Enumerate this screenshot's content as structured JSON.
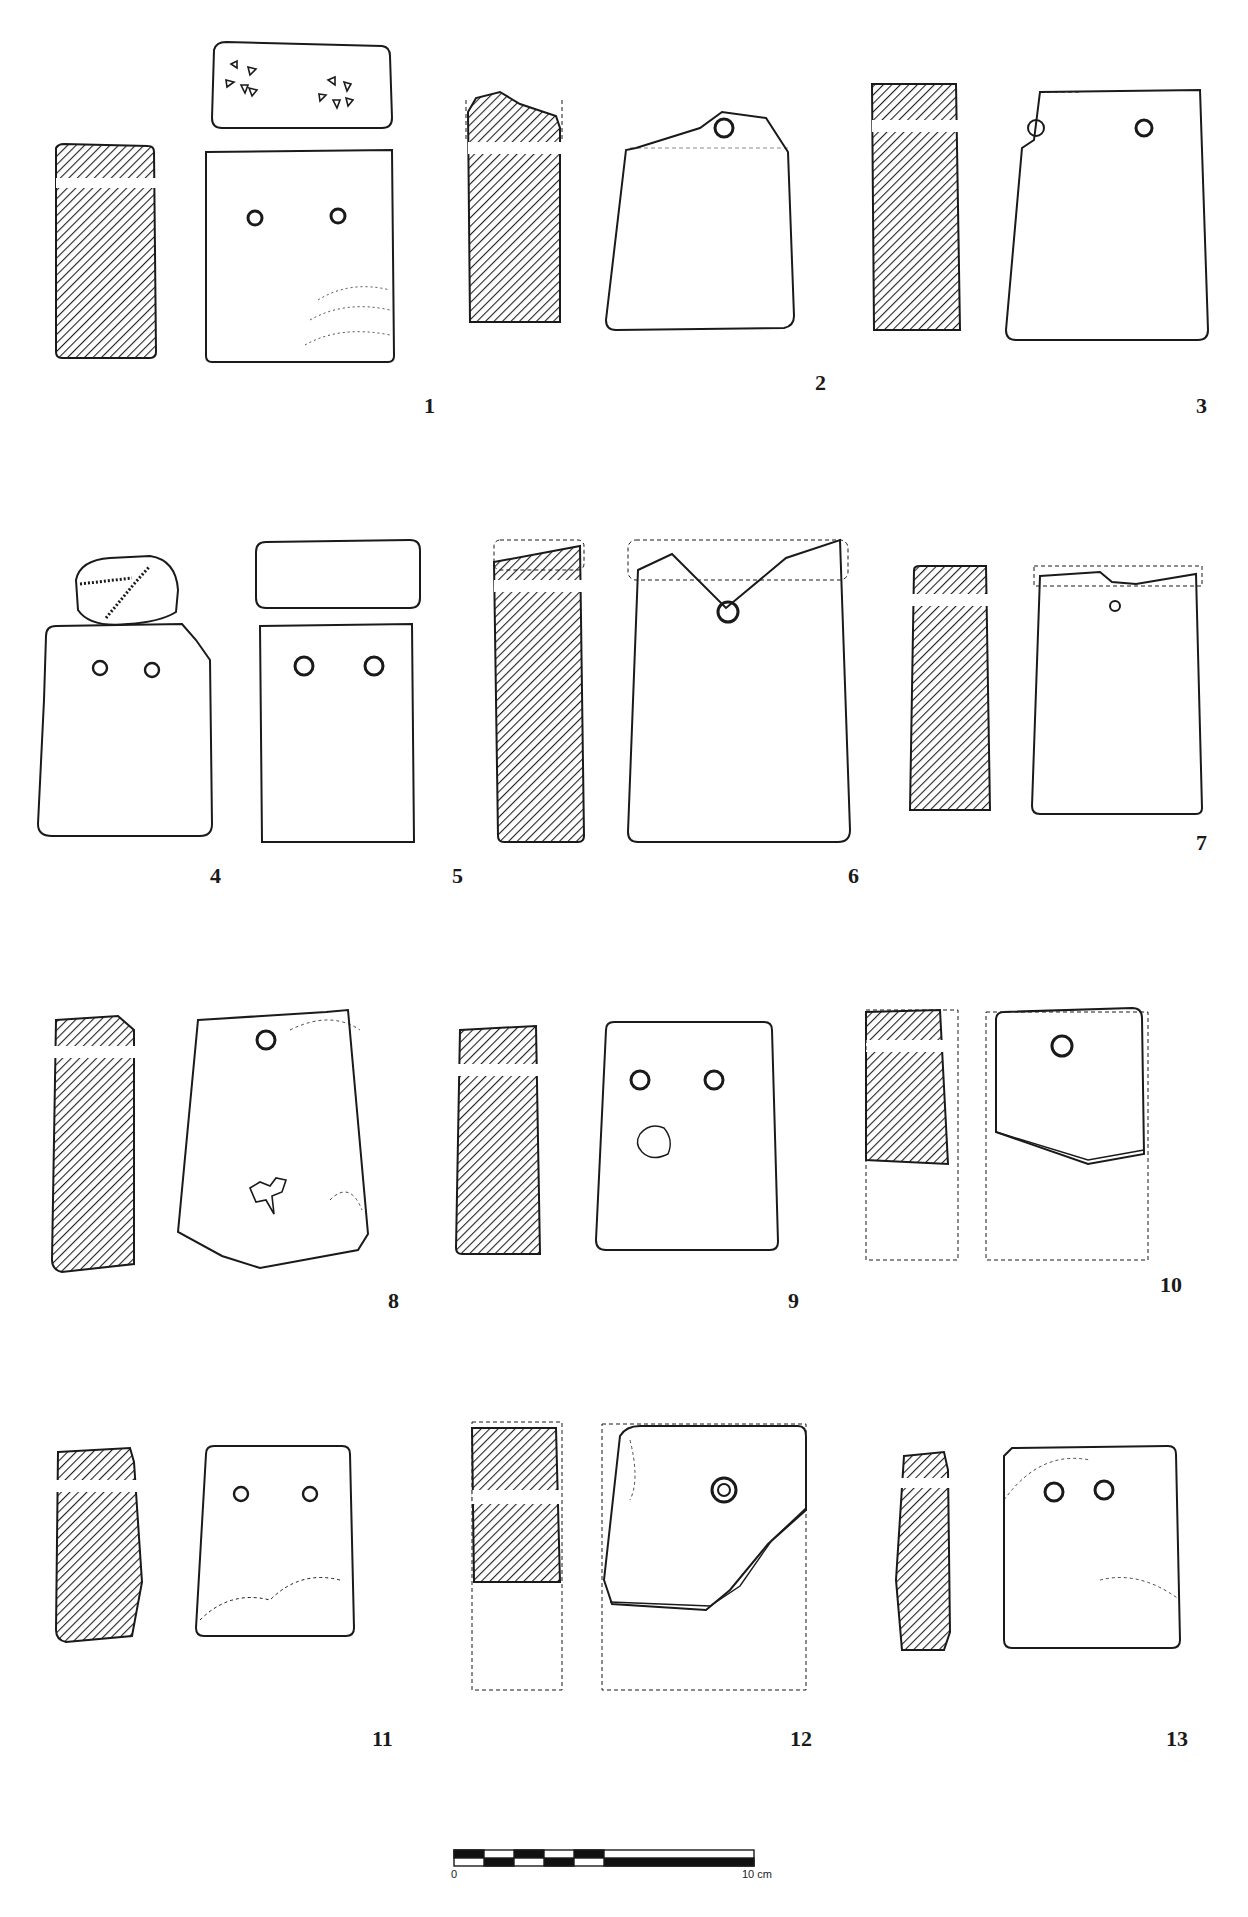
{
  "figure": {
    "type": "archaeological-plate",
    "objects": [
      {
        "number": "1",
        "views": [
          "section",
          "top",
          "face"
        ],
        "holes": 2,
        "top_decoration": "two rosettes of 4-5 triangular punches"
      },
      {
        "number": "2",
        "views": [
          "section",
          "face"
        ],
        "holes": 1,
        "broken_top": true
      },
      {
        "number": "3",
        "views": [
          "section",
          "face"
        ],
        "holes": 2,
        "broken_top": true
      },
      {
        "number": "4",
        "views": [
          "top",
          "face"
        ],
        "holes": 2,
        "top_decoration": "incised dotted lines"
      },
      {
        "number": "5",
        "views": [
          "top",
          "face"
        ],
        "holes": 2
      },
      {
        "number": "6",
        "views": [
          "section",
          "face"
        ],
        "holes": 1,
        "broken_top": true
      },
      {
        "number": "7",
        "views": [
          "section",
          "face"
        ],
        "holes": 1,
        "broken_top": true
      },
      {
        "number": "8",
        "views": [
          "section",
          "face"
        ],
        "holes": 1,
        "fragmentary": true
      },
      {
        "number": "9",
        "views": [
          "section",
          "face"
        ],
        "holes": 2
      },
      {
        "number": "10",
        "views": [
          "section",
          "face"
        ],
        "holes": 1,
        "fragmentary": true,
        "reconstructed_outline": "dashed"
      },
      {
        "number": "11",
        "views": [
          "section",
          "face"
        ],
        "holes": 2
      },
      {
        "number": "12",
        "views": [
          "section",
          "face"
        ],
        "holes": 1,
        "fragmentary": true,
        "reconstructed_outline": "dashed"
      },
      {
        "number": "13",
        "views": [
          "section",
          "face"
        ],
        "holes": 2
      }
    ]
  },
  "labels": [
    "1",
    "2",
    "3",
    "4",
    "5",
    "6",
    "7",
    "8",
    "9",
    "10",
    "11",
    "12",
    "13"
  ],
  "scale_bar": {
    "start_label": "0",
    "end_label": "10 cm"
  },
  "colors": {
    "ink": "#1a1a1a",
    "paper": "#ffffff"
  }
}
